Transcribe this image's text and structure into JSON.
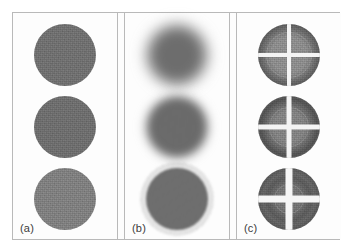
{
  "figure": {
    "type": "image-panel-grid",
    "rows": 3,
    "columns": 3,
    "background_color": "#fdfdfd",
    "frame_color": "#b9b9b9",
    "label_color": "#3b3b3b"
  },
  "panels": [
    {
      "id": "a",
      "label": "(a)",
      "description": "sharp-edged uniform noisy gray disks",
      "cells": [
        {
          "row": 0,
          "fill": "#7c7c7c",
          "edge": "sharp",
          "blur_px": 0,
          "radius_px": 31,
          "grain": 0.55
        },
        {
          "row": 1,
          "fill": "#7a7a7a",
          "edge": "sharp",
          "blur_px": 0,
          "radius_px": 31,
          "grain": 0.55
        },
        {
          "row": 2,
          "fill": "#8d8d8d",
          "edge": "sharp",
          "blur_px": 0,
          "radius_px": 31,
          "grain": 0.55
        }
      ]
    },
    {
      "id": "b",
      "label": "(b)",
      "description": "same disks with decreasing blur from top to bottom",
      "cells": [
        {
          "row": 0,
          "fill": "#767676",
          "edge": "soft",
          "blur_px": 7,
          "radius_px": 29,
          "grain": 0.4
        },
        {
          "row": 1,
          "fill": "#747474",
          "edge": "soft",
          "blur_px": 4,
          "radius_px": 30,
          "grain": 0.45
        },
        {
          "row": 2,
          "fill": "#7a7a7a",
          "edge": "sharp",
          "blur_px": 1,
          "radius_px": 31,
          "grain": 0.55
        }
      ]
    },
    {
      "id": "c",
      "label": "(c)",
      "description": "frequency-domain disks with bright cross artifact and concentric ring structure; cross width grows downward",
      "cells": [
        {
          "row": 0,
          "fill": "#6f6f6f",
          "core": "#9a9a9a",
          "ring": "#5d5d5d",
          "cross_px": 4,
          "cross_color": "#f4f4f4",
          "radius_px": 31,
          "core_radius_px": 21,
          "grain": 0.5
        },
        {
          "row": 1,
          "fill": "#6d6d6d",
          "core": "#8f8f8f",
          "ring": "#5a5a5a",
          "cross_px": 5,
          "cross_color": "#f4f4f4",
          "radius_px": 31,
          "core_radius_px": 18,
          "grain": 0.5
        },
        {
          "row": 2,
          "fill": "#6e6e6e",
          "core": "#7f7f7f",
          "ring": "#636363",
          "cross_px": 7,
          "cross_color": "#f6f6f6",
          "radius_px": 31,
          "core_radius_px": 13,
          "grain": 0.5
        }
      ]
    }
  ],
  "chart_data": {
    "type": "heatmap",
    "title": "",
    "xlabel": "",
    "ylabel": "",
    "subtitle": "",
    "legend": [],
    "grid": false,
    "panel_labels": [
      "(a)",
      "(b)",
      "(c)"
    ],
    "rows": 3,
    "columns": 3,
    "series": [
      {
        "name": "(a) original disks",
        "values": [
          "sharp disk",
          "sharp disk",
          "sharp disk (lighter)"
        ]
      },
      {
        "name": "(b) blurred disks",
        "values": [
          "heavy blur",
          "moderate blur",
          "no blur"
        ]
      },
      {
        "name": "(c) spectra with cross",
        "values": [
          "thin cross + ring",
          "medium cross + ring",
          "wide cross"
        ]
      }
    ]
  }
}
